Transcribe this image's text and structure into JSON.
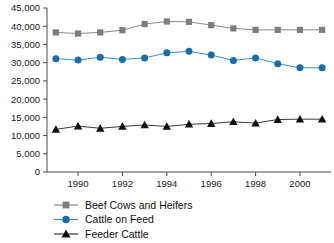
{
  "chart_data": {
    "type": "line",
    "title": "",
    "xlabel": "",
    "ylabel": "",
    "xlim": [
      1988.6,
      2001.4
    ],
    "ylim": [
      0,
      45000
    ],
    "grid": false,
    "legend_position": "bottom-left",
    "x": [
      1989,
      1990,
      1991,
      1992,
      1993,
      1994,
      1995,
      1996,
      1997,
      1998,
      1999,
      2000,
      2001
    ],
    "xticks": [
      1990,
      1992,
      1994,
      1996,
      1998,
      2000
    ],
    "xtick_labels": [
      "1990",
      "1992",
      "1994",
      "1996",
      "1998",
      "2000"
    ],
    "yticks": [
      0,
      5000,
      10000,
      15000,
      20000,
      25000,
      30000,
      35000,
      40000,
      45000
    ],
    "ytick_labels": [
      "0",
      "5,000",
      "10,000",
      "15,000",
      "20,000",
      "25,000",
      "30,000",
      "35,000",
      "40,000",
      "45,000"
    ],
    "series": [
      {
        "name": "Beef Cows and Heifers",
        "marker": "square",
        "color": "#7d7d7d",
        "line_color": "#8a8a8a",
        "values": [
          38300,
          38000,
          38300,
          38900,
          40600,
          41300,
          41200,
          40300,
          39400,
          39000,
          39000,
          39000,
          39000
        ]
      },
      {
        "name": "Cattle on Feed",
        "marker": "circle",
        "color": "#1c6ca8",
        "line_color": "#3a8fc4",
        "values": [
          31100,
          30700,
          31500,
          30900,
          31300,
          32700,
          33100,
          32100,
          30600,
          31300,
          29700,
          28600,
          28600
        ]
      },
      {
        "name": "Feeder Cattle",
        "marker": "triangle",
        "color": "#111111",
        "line_color": "#3a3a3a",
        "values": [
          11700,
          12600,
          12000,
          12500,
          12900,
          12500,
          13100,
          13300,
          13800,
          13400,
          14400,
          14500,
          14500
        ]
      }
    ]
  },
  "legend": {
    "items": [
      {
        "label": "Beef Cows and Heifers"
      },
      {
        "label": "Cattle on Feed"
      },
      {
        "label": "Feeder Cattle"
      }
    ]
  }
}
